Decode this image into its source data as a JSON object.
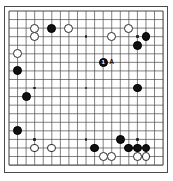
{
  "app": {
    "title": "Go Board Diagram",
    "background_color": "#ffffff"
  },
  "board": {
    "name": "go-board",
    "size": 19,
    "line_color": "#4a4a4a",
    "border_color": "#4a4a4a",
    "black_color": "#111111",
    "white_color": "#ffffff",
    "origin_x": 9,
    "origin_y": 11,
    "spacing": 8.56,
    "hoshi": [
      [
        3,
        3
      ],
      [
        9,
        3
      ],
      [
        15,
        3
      ],
      [
        3,
        9
      ],
      [
        9,
        9
      ],
      [
        15,
        9
      ],
      [
        3,
        15
      ],
      [
        9,
        15
      ],
      [
        15,
        15
      ]
    ],
    "stones": [
      {
        "color": "white",
        "col": 3,
        "row": 2,
        "label": ""
      },
      {
        "color": "black",
        "col": 5,
        "row": 2,
        "label": ""
      },
      {
        "color": "white",
        "col": 7,
        "row": 2,
        "label": ""
      },
      {
        "color": "white",
        "col": 14,
        "row": 2,
        "label": ""
      },
      {
        "color": "white",
        "col": 3,
        "row": 3,
        "label": ""
      },
      {
        "color": "white",
        "col": 12,
        "row": 3,
        "label": ""
      },
      {
        "color": "black",
        "col": 16,
        "row": 3,
        "label": ""
      },
      {
        "color": "black",
        "col": 15,
        "row": 4,
        "label": ""
      },
      {
        "color": "white",
        "col": 1,
        "row": 5,
        "label": ""
      },
      {
        "color": "black",
        "col": 11,
        "row": 6,
        "label": "1"
      },
      {
        "color": "black",
        "col": 1,
        "row": 7,
        "label": ""
      },
      {
        "color": "black",
        "col": 15,
        "row": 9,
        "label": ""
      },
      {
        "color": "black",
        "col": 2,
        "row": 10,
        "label": ""
      },
      {
        "color": "black",
        "col": 1,
        "row": 14,
        "label": ""
      },
      {
        "color": "black",
        "col": 13,
        "row": 15,
        "label": ""
      },
      {
        "color": "white",
        "col": 3,
        "row": 16,
        "label": ""
      },
      {
        "color": "white",
        "col": 5,
        "row": 16,
        "label": ""
      },
      {
        "color": "black",
        "col": 10,
        "row": 16,
        "label": ""
      },
      {
        "color": "black",
        "col": 14,
        "row": 16,
        "label": ""
      },
      {
        "color": "black",
        "col": 15,
        "row": 16,
        "label": ""
      },
      {
        "color": "black",
        "col": 16,
        "row": 16,
        "label": ""
      },
      {
        "color": "white",
        "col": 11,
        "row": 17,
        "label": ""
      },
      {
        "color": "white",
        "col": 12,
        "row": 17,
        "label": ""
      },
      {
        "color": "white",
        "col": 15,
        "row": 17,
        "label": ""
      },
      {
        "color": "white",
        "col": 16,
        "row": 17,
        "label": ""
      }
    ],
    "point_labels": [
      {
        "text": "A",
        "col": 12,
        "row": 6
      }
    ]
  }
}
